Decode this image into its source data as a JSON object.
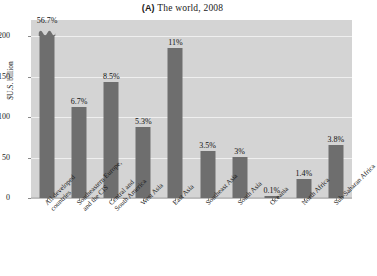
{
  "chart_data": {
    "type": "bar",
    "title": "(A) The world, 2008",
    "title_tag": "(A)",
    "title_rest": " The world, 2008",
    "xlabel": "",
    "ylabel": "$U.S. billion",
    "ylim": [
      0,
      220
    ],
    "yticks": [
      0,
      50,
      100,
      150,
      200
    ],
    "ytick_labels": [
      "0",
      "50",
      "100",
      "150",
      "200"
    ],
    "grid": true,
    "legend": "none",
    "note": "First bar is truncated with an axis-break marker; its true value exceeds the plotted range.",
    "categories": [
      "All developed countries",
      "Southeastern Europe, and the CIS",
      "Central and South America",
      "West Asia",
      "East Asia",
      "Southeast Asia",
      "South Asia",
      "Oceania",
      "North Africa",
      "Sub-Saharan Africa"
    ],
    "category_lines": [
      [
        "All developed",
        "countries"
      ],
      [
        "Southeastern Europe,",
        "and the CIS"
      ],
      [
        "Central and",
        "South America"
      ],
      [
        "West Asia",
        ""
      ],
      [
        "East Asia",
        ""
      ],
      [
        "Southeast Asia",
        ""
      ],
      [
        "South Asia",
        ""
      ],
      [
        "Oceania",
        ""
      ],
      [
        "North Africa",
        ""
      ],
      [
        "Sub-Saharan Africa",
        ""
      ]
    ],
    "values": [
      205,
      113,
      143,
      88,
      185,
      58,
      51,
      2,
      24,
      65
    ],
    "value_labels": [
      "56.7%",
      "6.7%",
      "8.5%",
      "5.3%",
      "11%",
      "3.5%",
      "3%",
      "0.1%",
      "1.4%",
      "3.8%"
    ],
    "truncated": [
      true,
      false,
      false,
      false,
      false,
      false,
      false,
      false,
      false,
      false
    ],
    "colors": {
      "bar": "#6e6e6e",
      "plot_background": "#d4d4d4",
      "gridline": "#efefef",
      "page_background": "#ffffff",
      "text": "#1a1a1a"
    }
  }
}
